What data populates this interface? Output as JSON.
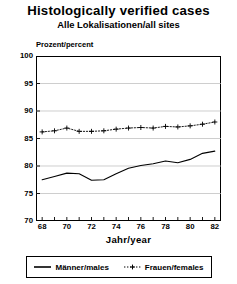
{
  "title": "Histologically verified cases",
  "subtitle": "Alle Lokalisationen/all sites",
  "axis": {
    "ylabel": "Prozent/percent",
    "xlabel": "Jahr/year"
  },
  "legend": {
    "items": [
      {
        "label": "Männer/males",
        "style": "solid",
        "color": "#000000"
      },
      {
        "label": "Frauen/females",
        "style": "dotted-plus",
        "color": "#000000"
      }
    ]
  },
  "chart_data": {
    "type": "line",
    "title": "Histologically verified cases",
    "subtitle": "Alle Lokalisationen/all sites",
    "xlabel": "Jahr/year",
    "ylabel": "Prozent/percent",
    "xlim": [
      67.5,
      82.5
    ],
    "ylim": [
      70,
      100
    ],
    "yticks": [
      70,
      75,
      80,
      85,
      90,
      95,
      100
    ],
    "ytick_labels": [
      "70",
      "75",
      "80",
      "85",
      "90",
      "95",
      "100"
    ],
    "xticks": [
      68,
      69,
      70,
      71,
      72,
      73,
      74,
      75,
      76,
      77,
      78,
      79,
      80,
      81,
      82
    ],
    "xtick_labels_shown": [
      "68",
      "70",
      "72",
      "74",
      "76",
      "78",
      "80",
      "82"
    ],
    "xtick_labels_values": [
      68,
      70,
      72,
      74,
      76,
      78,
      80,
      82
    ],
    "grid": "horizontal",
    "legend_position": "below",
    "x": [
      68,
      69,
      70,
      71,
      72,
      73,
      74,
      75,
      76,
      77,
      78,
      79,
      80,
      81,
      82
    ],
    "series": [
      {
        "name": "Männer/males",
        "style": "solid",
        "marker": "none",
        "values": [
          77.5,
          78.1,
          78.7,
          78.6,
          77.4,
          77.5,
          78.6,
          79.6,
          80.1,
          80.4,
          80.9,
          80.6,
          81.2,
          82.3,
          82.7
        ]
      },
      {
        "name": "Frauen/females",
        "style": "dotted",
        "marker": "plus",
        "values": [
          86.2,
          86.4,
          86.9,
          86.3,
          86.3,
          86.4,
          86.7,
          86.9,
          87.0,
          86.9,
          87.2,
          87.1,
          87.3,
          87.6,
          88.0
        ]
      }
    ]
  }
}
